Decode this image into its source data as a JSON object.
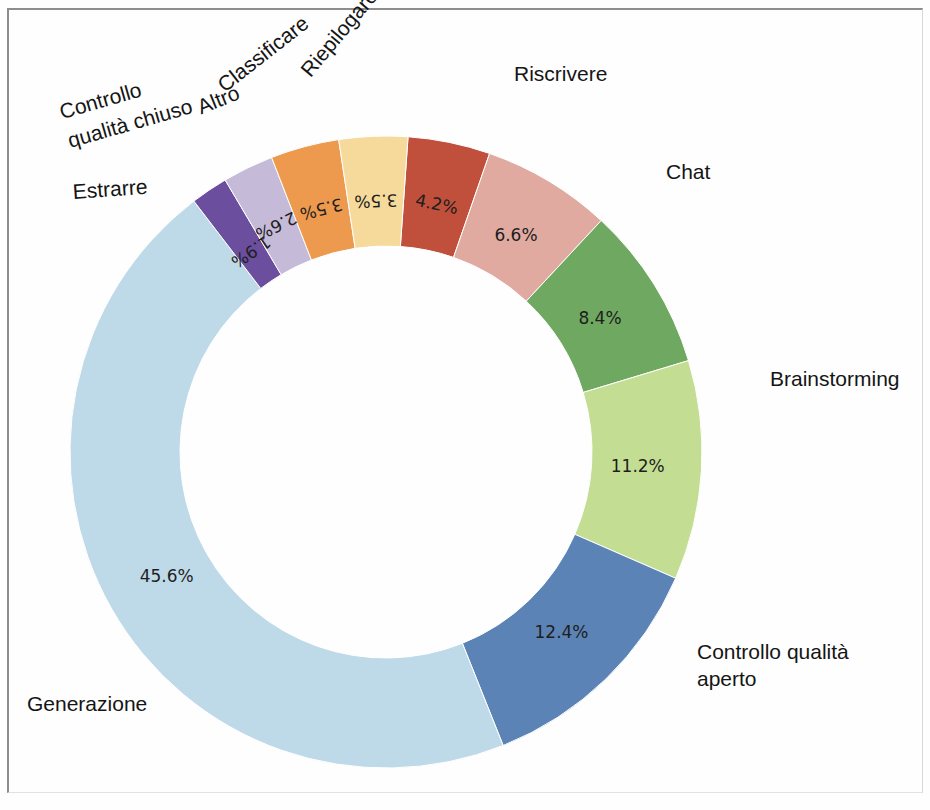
{
  "chart_data": {
    "type": "pie",
    "variant": "donut",
    "title": "",
    "subtitle": "",
    "xlabel": "",
    "ylabel": "",
    "legend_position": "outside-labels",
    "grid": false,
    "value_suffix": "%",
    "start_angle_deg": -86,
    "direction": "clockwise",
    "categories": [
      "Riepilogare",
      "Riscrivere",
      "Chat",
      "Brainstorming",
      "Controllo qualità aperto",
      "Generazione",
      "Estrarre",
      "Controllo qualità chiuso",
      "Altro",
      "Classificare"
    ],
    "values": [
      4.2,
      6.6,
      8.4,
      11.2,
      12.4,
      45.6,
      1.9,
      2.6,
      3.5,
      3.5
    ],
    "value_labels": [
      "4.2%",
      "6.6%",
      "8.4%",
      "11.2%",
      "12.4%",
      "45.6%",
      "1.9%",
      "2.6%",
      "3.5%",
      "3.5%"
    ],
    "colors": [
      "#c0503c",
      "#e0aaa0",
      "#6fa860",
      "#c3de93",
      "#5b83b5",
      "#bedae9",
      "#6b4e9e",
      "#c5bbd8",
      "#ed9a4f",
      "#f5da9b"
    ]
  },
  "labels": {
    "riepilogare": "Riepilogare",
    "riscrivere": "Riscrivere",
    "chat": "Chat",
    "brainstorming": "Brainstorming",
    "controllo_qualita_aperto_line1": "Controllo qualità",
    "controllo_qualita_aperto_line2": "aperto",
    "generazione": "Generazione",
    "estrarre": "Estrarre",
    "controllo_qualita_chiuso_line1": "Controllo",
    "controllo_qualita_chiuso_line2": "qualità chiuso",
    "altro": "Altro",
    "classificare": "Classificare"
  },
  "values": {
    "riepilogare": "4.2%",
    "riscrivere": "6.6%",
    "chat": "8.4%",
    "brainstorming": "11.2%",
    "controllo_qualita_aperto": "12.4%",
    "generazione": "45.6%",
    "estrarre": "1.9%",
    "controllo_qualita_chiuso": "2.6%",
    "altro": "3.5%",
    "classificare": "3.5%"
  }
}
